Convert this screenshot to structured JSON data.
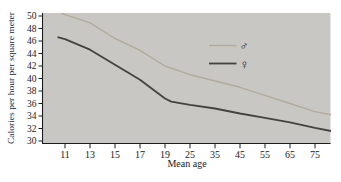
{
  "figure": {
    "plot_bg_color": "#c8c7c4",
    "axis_color": "#1c1c1c",
    "y_axis_label": "Calories per hour per square meter",
    "x_axis_label": "Mean age"
  },
  "chart_data": {
    "type": "line",
    "title": "",
    "xlabel": "Mean age",
    "ylabel": "Calories per hour per square meter",
    "x_ticks": [
      11,
      13,
      15,
      17,
      19,
      25,
      35,
      45,
      55,
      65,
      75
    ],
    "x_scale_note": "tick marks evenly spaced despite unequal age intervals",
    "ylim": [
      30,
      50
    ],
    "y_tick_step": 2,
    "grid": false,
    "legend_position": "upper right inside plot",
    "series": [
      {
        "name": "male",
        "symbol": "♂",
        "color": "#b2aa9b",
        "line_width": 1.4,
        "values_at_ticks": [
          50.2,
          48.9,
          46.4,
          44.5,
          42.0,
          40.6,
          39.6,
          38.6,
          37.3,
          36.0,
          34.7
        ],
        "line_points": [
          [
            -0.45,
            51.2
          ],
          [
            0,
            50.2
          ],
          [
            1,
            48.9
          ],
          [
            2,
            46.4
          ],
          [
            3,
            44.5
          ],
          [
            4,
            42.0
          ],
          [
            5,
            40.6
          ],
          [
            6,
            39.6
          ],
          [
            7,
            38.6
          ],
          [
            8,
            37.3
          ],
          [
            9,
            36.0
          ],
          [
            10,
            34.7
          ],
          [
            10.64,
            34.2
          ]
        ]
      },
      {
        "name": "female",
        "symbol": "♀",
        "color": "#45433f",
        "line_width": 1.8,
        "values_at_ticks": [
          46.3,
          44.6,
          42.2,
          39.8,
          36.8,
          35.8,
          35.2,
          34.4,
          33.7,
          33.0,
          32.1
        ],
        "line_points": [
          [
            -0.3,
            46.6
          ],
          [
            0,
            46.3
          ],
          [
            1,
            44.6
          ],
          [
            2,
            42.2
          ],
          [
            3,
            39.8
          ],
          [
            4,
            36.8
          ],
          [
            4.25,
            36.3
          ],
          [
            5,
            35.8
          ],
          [
            6,
            35.2
          ],
          [
            7,
            34.4
          ],
          [
            8,
            33.7
          ],
          [
            9,
            33.0
          ],
          [
            10,
            32.1
          ],
          [
            10.64,
            31.6
          ]
        ]
      }
    ]
  }
}
